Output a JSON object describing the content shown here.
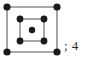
{
  "figure": {
    "name": "unit-cell-lattice-diagram",
    "background_color": "#ffffff",
    "outer_square": {
      "label": "outer-square",
      "line_color": "#8c8c8c",
      "line_width": 1.6,
      "corner_points": [
        {
          "x": 7,
          "y": 7
        },
        {
          "x": 57,
          "y": 7
        },
        {
          "x": 57,
          "y": 52
        },
        {
          "x": 7,
          "y": 52
        }
      ],
      "point_count": 4
    },
    "inner_square": {
      "label": "inner-square",
      "line_color": "#6e6e6e",
      "line_width": 1.2,
      "corner_points": [
        {
          "x": 20,
          "y": 19
        },
        {
          "x": 44,
          "y": 19
        },
        {
          "x": 44,
          "y": 41
        },
        {
          "x": 20,
          "y": 41
        }
      ],
      "point_count": 4
    },
    "center_point": {
      "label": "center-point",
      "x": 32,
      "y": 30,
      "radius": 3.2
    },
    "point_style": {
      "fill_color": "#1a1a1a",
      "outer_radius": 3.6,
      "inner_radius": 3.2
    }
  },
  "annotation": {
    "text": "; 4",
    "value": "4",
    "separator": ";",
    "color": "#2a2a2a"
  }
}
